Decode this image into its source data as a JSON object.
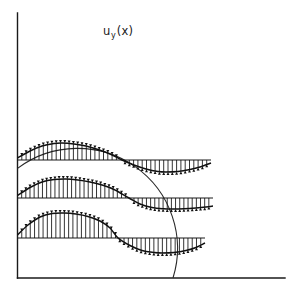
{
  "figure": {
    "title_parts": {
      "base": "u",
      "subscript": "y",
      "argument": "(x)"
    },
    "background_color": "#ffffff",
    "line_color": "#111111",
    "width": 299,
    "height": 296
  },
  "axes": {
    "y_axis": {
      "x": 17.5,
      "y_top": 13,
      "y_bottom": 278
    },
    "x_axis": {
      "y": 278,
      "x_left": 17.5,
      "x_right": 285
    },
    "color": "#1a1a1a"
  },
  "chart_data": {
    "type": "line",
    "xlabel": "",
    "ylabel": "",
    "grid": false,
    "legend": null,
    "cylinder": {
      "shape": "circle",
      "center_x": 113,
      "center_y": 198,
      "radius": 100,
      "left_axis_intersection_y": 128,
      "top_y": 98,
      "right_x": 213,
      "bottom_axis_intersection_x": 188
    },
    "series": [
      {
        "name": "profile-top",
        "baseline_y": 160,
        "x_start": 17.5,
        "x_end": 211,
        "zero_crossing_x": 122,
        "peak_positive_x": 62,
        "peak_positive_amplitude": 17,
        "peak_negative_x": 166,
        "peak_negative_amplitude": -12,
        "arrow_count": 45,
        "x": [
          17.5,
          30,
          42,
          54,
          62,
          74,
          86,
          98,
          110,
          122,
          134,
          146,
          158,
          166,
          178,
          190,
          200,
          211
        ],
        "values": [
          2,
          9,
          14,
          16.5,
          17,
          16,
          14,
          10.5,
          6,
          0,
          -5,
          -9,
          -11.5,
          -12,
          -11.5,
          -9.5,
          -7,
          -3
        ]
      },
      {
        "name": "profile-middle",
        "baseline_y": 198,
        "x_start": 17.5,
        "x_end": 213,
        "zero_crossing_x": 129,
        "peak_positive_x": 66,
        "peak_positive_amplitude": 19,
        "peak_negative_x": 172,
        "peak_negative_amplitude": -11,
        "arrow_count": 47,
        "x": [
          17.5,
          30,
          42,
          54,
          66,
          78,
          90,
          102,
          114,
          129,
          140,
          152,
          164,
          172,
          184,
          196,
          206,
          213
        ],
        "values": [
          2.5,
          10.5,
          16,
          18.5,
          19,
          18,
          16,
          13,
          8.5,
          0,
          -6,
          -9.5,
          -10.8,
          -11,
          -10.8,
          -10,
          -9,
          -8
        ]
      },
      {
        "name": "profile-bottom",
        "baseline_y": 238,
        "x_start": 17.5,
        "x_end": 205,
        "zero_crossing_x": 118,
        "peak_positive_x": 64,
        "peak_positive_amplitude": 25,
        "peak_negative_x": 162,
        "peak_negative_amplitude": -15,
        "arrow_count": 44,
        "x": [
          17.5,
          28,
          40,
          52,
          64,
          76,
          88,
          100,
          110,
          118,
          130,
          142,
          154,
          162,
          174,
          186,
          196,
          205
        ],
        "values": [
          3,
          13,
          21,
          24.5,
          25,
          24,
          21.5,
          17,
          10,
          0,
          -7.5,
          -12.5,
          -14.5,
          -15,
          -14.5,
          -12.5,
          -9.5,
          -5
        ]
      }
    ]
  }
}
